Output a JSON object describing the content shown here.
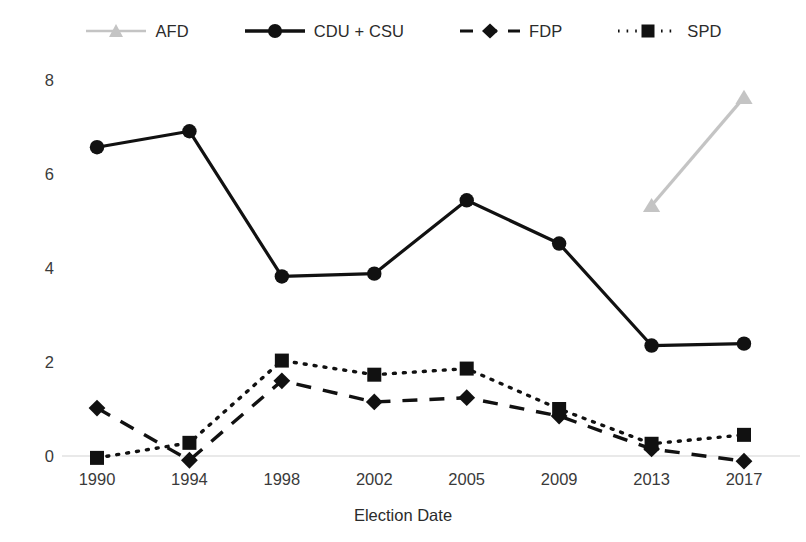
{
  "chart_data": {
    "type": "line",
    "title": "",
    "subtitle": "",
    "xlabel": "Election Date",
    "ylabel": "",
    "categories": [
      "1990",
      "1994",
      "1998",
      "2002",
      "2005",
      "2009",
      "2013",
      "2017"
    ],
    "x_is_categorical": true,
    "ylim": [
      -0.2,
      8.2
    ],
    "yticks": [
      0,
      2,
      4,
      6,
      8
    ],
    "ytick_labels": [
      "0",
      "2",
      "4",
      "6",
      "8"
    ],
    "grid": false,
    "zero_baseline": true,
    "legend_position": "top",
    "series": [
      {
        "name": "AFD",
        "color": "#c4c4c4",
        "marker": "triangle",
        "line_style": "solid",
        "values": [
          null,
          null,
          null,
          null,
          null,
          null,
          5.33,
          7.63
        ]
      },
      {
        "name": "CDU + CSU",
        "color": "#111111",
        "marker": "circle",
        "line_style": "solid",
        "values": [
          6.57,
          6.91,
          3.82,
          3.88,
          5.44,
          4.52,
          2.35,
          2.39
        ]
      },
      {
        "name": "FDP",
        "color": "#111111",
        "marker": "diamond",
        "line_style": "dashed",
        "values": [
          1.02,
          -0.09,
          1.6,
          1.15,
          1.24,
          0.85,
          0.15,
          -0.11
        ]
      },
      {
        "name": "SPD",
        "color": "#111111",
        "marker": "square",
        "line_style": "dotted",
        "values": [
          -0.04,
          0.28,
          2.03,
          1.73,
          1.86,
          1.0,
          0.26,
          0.45
        ]
      }
    ]
  },
  "legend": {
    "items": [
      {
        "label": "AFD",
        "icon": "triangle-marker-icon"
      },
      {
        "label": "CDU + CSU",
        "icon": "circle-marker-icon"
      },
      {
        "label": "FDP",
        "icon": "diamond-marker-icon"
      },
      {
        "label": "SPD",
        "icon": "square-marker-icon"
      }
    ]
  },
  "axes": {
    "x_title": "Election Date",
    "x_tick_labels": [
      "1990",
      "1994",
      "1998",
      "2002",
      "2005",
      "2009",
      "2013",
      "2017"
    ],
    "y_tick_labels": [
      "0",
      "2",
      "4",
      "6",
      "8"
    ]
  },
  "colors": {
    "afd": "#c4c4c4",
    "series_black": "#111111",
    "text": "#2b2b2b",
    "baseline": "#e2e2e2"
  }
}
